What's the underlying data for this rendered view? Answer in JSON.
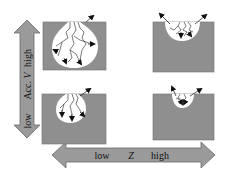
{
  "diagram": {
    "type": "2x2 grid of penetration-depth sketches",
    "vertical_axis": {
      "label": "Acc. V",
      "label_prefix": "Acc. ",
      "label_var": "V",
      "low": "low",
      "high": "high"
    },
    "horizontal_axis": {
      "label": "Z",
      "low": "low",
      "high": "high"
    },
    "panels": [
      {
        "position": "top-left",
        "acc": "high",
        "z": "low",
        "description": "large deep circular interaction region with branching tracks and outward arrows"
      },
      {
        "position": "top-right",
        "acc": "high",
        "z": "high",
        "description": "shallow half-circle region near surface with branching tracks, arrows escaping upward"
      },
      {
        "position": "bottom-left",
        "acc": "low",
        "z": "low",
        "description": "medium circular region with tracks, one arrow escaping upward"
      },
      {
        "position": "bottom-right",
        "acc": "low",
        "z": "high",
        "description": "small shallow region near surface, arrows escaping upward"
      }
    ],
    "colors": {
      "box_fill": "#8f8f8f",
      "box_stroke": "#6f6f6f",
      "arrow_fill": "#9a9a9a",
      "arrow_stroke": "#6a6a6a",
      "region_fill": "#ffffff",
      "track": "#222222"
    }
  }
}
